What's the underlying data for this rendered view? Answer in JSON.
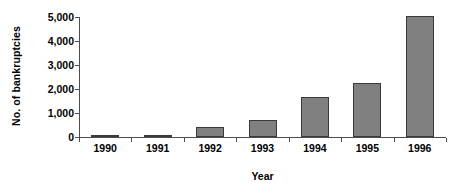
{
  "chart_data": {
    "type": "bar",
    "title": "",
    "subtitle": "",
    "xlabel": "Year",
    "ylabel": "No. of bankruptcies",
    "categories": [
      "1990",
      "1991",
      "1992",
      "1993",
      "1994",
      "1995",
      "1996"
    ],
    "values": [
      50,
      100,
      420,
      720,
      1670,
      2250,
      5050
    ],
    "series": [
      {
        "name": "No. of bankruptcies",
        "values": [
          50,
          100,
          420,
          720,
          1670,
          2250,
          5050
        ]
      }
    ],
    "ylim": [
      0,
      5000
    ],
    "y_ticks": [
      0,
      1000,
      2000,
      3000,
      4000,
      5000
    ],
    "y_tick_labels": [
      "0",
      "1,000",
      "2,000",
      "3,000",
      "4,000",
      "5,000"
    ],
    "grid": false,
    "legend": false,
    "legend_position": "none",
    "bar_fill_color": "#808080",
    "bar_border_color": "#3a3a3a",
    "axis_color": "#4d4d4d",
    "background_color": "#ffffff",
    "text_color": "#000000"
  }
}
